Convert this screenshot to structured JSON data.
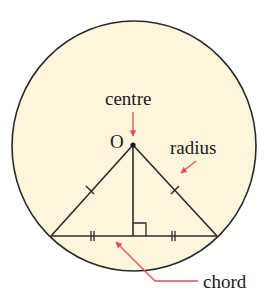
{
  "diagram": {
    "colors": {
      "fill": "#fdf6dc",
      "stroke": "#2a2a2a",
      "arrow": "#e0505a"
    },
    "labels": {
      "centre_point": "O",
      "centre": "centre",
      "radius": "radius",
      "chord": "chord"
    },
    "annotations": {
      "radii_equal_ticks": "single tick on each radius",
      "chord_halves_equal_ticks": "double tick on each half of chord",
      "right_angle": "perpendicular from centre to chord"
    }
  }
}
